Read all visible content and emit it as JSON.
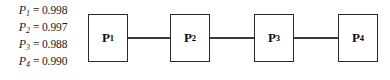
{
  "figure": {
    "type": "reliability-block-diagram",
    "width": 390,
    "height": 80,
    "background_color": "#ffffff",
    "stroke_color": "#2a2a2a",
    "text_color": "#1a1a1a"
  },
  "equations": {
    "items": [
      {
        "variable": "P",
        "subscript": "1",
        "operator": "=",
        "value": "0.998",
        "text": "P1 = 0.998"
      },
      {
        "variable": "P",
        "subscript": "2",
        "operator": "=",
        "value": "0.997",
        "text": "P2 = 0.997"
      },
      {
        "variable": "P",
        "subscript": "3",
        "operator": "=",
        "value": "0.988",
        "text": "P3 = 0.988"
      },
      {
        "variable": "P",
        "subscript": "4",
        "operator": "=",
        "value": "0.990",
        "text": "P4 = 0.990"
      }
    ]
  },
  "diagram": {
    "arrangement": "series",
    "blocks": [
      {
        "label": "P",
        "subscript": "1",
        "text": "P1"
      },
      {
        "label": "P",
        "subscript": "2",
        "text": "P2"
      },
      {
        "label": "P",
        "subscript": "3",
        "text": "P3"
      },
      {
        "label": "P",
        "subscript": "4",
        "text": "P4"
      }
    ],
    "connectors": [
      {
        "from": "P1",
        "to": "P2"
      },
      {
        "from": "P2",
        "to": "P3"
      },
      {
        "from": "P3",
        "to": "P4"
      }
    ]
  }
}
